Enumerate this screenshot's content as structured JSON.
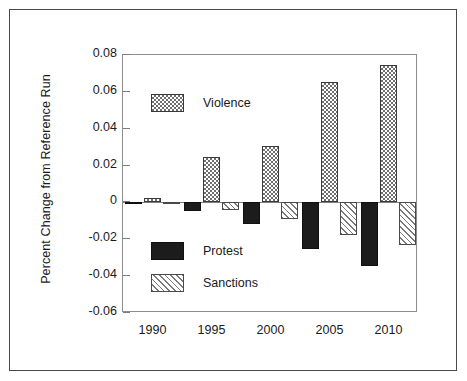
{
  "figure": {
    "ylabel": "Percent Change from Reference Run"
  },
  "axis": {
    "y_ticks": [
      "0.08",
      "0.06",
      "0.04",
      "0.02",
      "0",
      "-0.02",
      "-0.04",
      "-0.06"
    ],
    "x_ticks": [
      "1990",
      "1995",
      "2000",
      "2005",
      "2010"
    ]
  },
  "legend": {
    "items": [
      {
        "label": "Violence",
        "pattern": "checker-gray"
      },
      {
        "label": "Protest",
        "pattern": "solid-black"
      },
      {
        "label": "Sanctions",
        "pattern": "diagonal-hatch"
      }
    ]
  },
  "colors": {
    "protest": "#1c1c1c",
    "violence": "#6e6e6e",
    "sanctions": "#7a7a7a",
    "axis": "#7d7d7d",
    "frame": "#4a4a4a"
  },
  "chart_data": {
    "type": "bar",
    "title": "",
    "xlabel": "",
    "ylabel": "Percent Change from Reference Run",
    "categories": [
      "1990",
      "1995",
      "2000",
      "2005",
      "2010"
    ],
    "series": [
      {
        "name": "Protest",
        "values": [
          -0.0005,
          -0.0045,
          -0.0115,
          -0.0255,
          -0.0345
        ]
      },
      {
        "name": "Violence",
        "values": [
          0.0025,
          0.0245,
          0.0305,
          0.0655,
          0.0745
        ]
      },
      {
        "name": "Sanctions",
        "values": [
          -0.0003,
          -0.004,
          -0.009,
          -0.0175,
          -0.023
        ]
      }
    ],
    "series_order_in_group": [
      "Protest",
      "Violence",
      "Sanctions"
    ],
    "ylim": [
      -0.06,
      0.08
    ],
    "ytick_values": [
      0.08,
      0.06,
      0.04,
      0.02,
      0,
      -0.02,
      -0.04,
      -0.06
    ],
    "grid": false,
    "legend_position": "inside-left",
    "zero_reference_line": true
  }
}
